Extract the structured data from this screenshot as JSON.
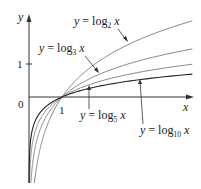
{
  "chart_data": {
    "type": "line",
    "title": "",
    "xlabel": "x",
    "ylabel": "y",
    "origin_label": "0",
    "x_ticks": [
      {
        "value": 1,
        "label": "1"
      }
    ],
    "y_ticks": [
      {
        "value": 1,
        "label": "1"
      }
    ],
    "xlim": [
      0,
      4.95
    ],
    "ylim": [
      -2.5,
      2.5
    ],
    "grid": false,
    "legend_position": "inline annotations with arrows",
    "series": [
      {
        "name": "y = log_2 x",
        "base": 2,
        "color": "#7a7a7a",
        "x": [
          0.05,
          0.25,
          0.5,
          1,
          2,
          3,
          4,
          4.94
        ],
        "values": [
          -4.32,
          -2.0,
          -1.0,
          0,
          1.0,
          1.58,
          2.0,
          2.3
        ]
      },
      {
        "name": "y = log_3 x",
        "base": 3,
        "color": "#7a7a7a",
        "x": [
          0.05,
          0.25,
          0.5,
          1,
          2,
          3,
          4,
          4.94
        ],
        "values": [
          -2.73,
          -1.26,
          -0.63,
          0,
          0.63,
          1.0,
          1.26,
          1.45
        ]
      },
      {
        "name": "y = log_5 x",
        "base": 5,
        "color": "#7a7a7a",
        "x": [
          0.05,
          0.25,
          0.5,
          1,
          2,
          3,
          4,
          4.94
        ],
        "values": [
          -1.86,
          -0.86,
          -0.43,
          0,
          0.43,
          0.68,
          0.86,
          0.99
        ]
      },
      {
        "name": "y = log_10 x",
        "base": 10,
        "color": "#222222",
        "x": [
          0.05,
          0.25,
          0.5,
          1,
          2,
          3,
          4,
          4.94
        ],
        "values": [
          -1.3,
          -0.6,
          -0.3,
          0,
          0.3,
          0.48,
          0.6,
          0.69
        ]
      }
    ],
    "annotations": [
      {
        "text_prefix": "y = log",
        "subscript": "2",
        "suffix": "x",
        "series": "y = log_2 x"
      },
      {
        "text_prefix": "y = log",
        "subscript": "3",
        "suffix": "x",
        "series": "y = log_3 x"
      },
      {
        "text_prefix": "y = log",
        "subscript": "5",
        "suffix": "x",
        "series": "y = log_5 x"
      },
      {
        "text_prefix": "y = log",
        "subscript": "10",
        "suffix": "x",
        "series": "y = log_10 x"
      }
    ]
  }
}
